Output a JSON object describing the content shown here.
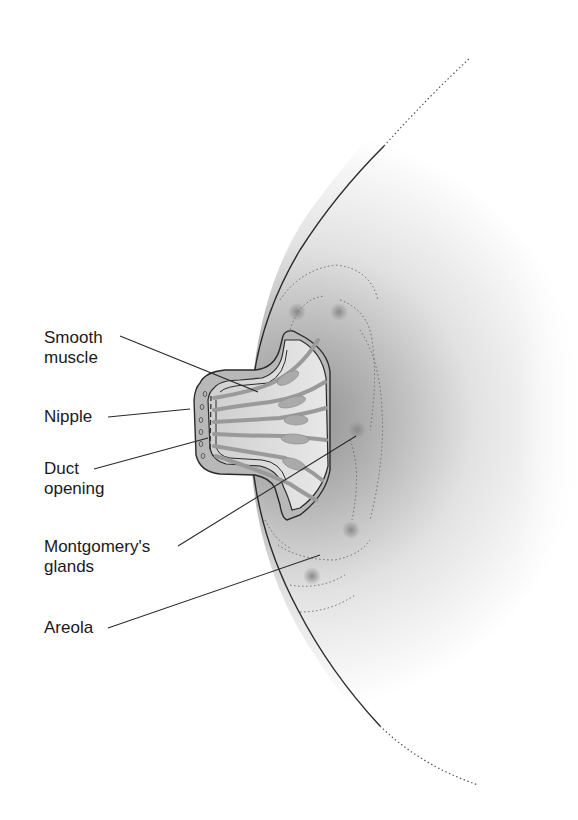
{
  "diagram": {
    "title": "",
    "labels": [
      {
        "id": "smooth-muscle",
        "text": "Smooth\nmuscle",
        "x": 44,
        "y": 328
      },
      {
        "id": "nipple",
        "text": "Nipple",
        "x": 44,
        "y": 407
      },
      {
        "id": "duct-opening",
        "text": "Duct\nopening",
        "x": 44,
        "y": 457
      },
      {
        "id": "montgomerys-glands",
        "text": "Montgomery's\nglands",
        "x": 44,
        "y": 537
      },
      {
        "id": "areola",
        "text": "Areola",
        "x": 44,
        "y": 616
      }
    ],
    "colors": {
      "outline": "#2a2a2a",
      "fill_dark": "#a6a6a6",
      "fill_light": "#f4f4f4",
      "leader_line": "#2a2a2a",
      "text": "#1a1a1a"
    }
  }
}
